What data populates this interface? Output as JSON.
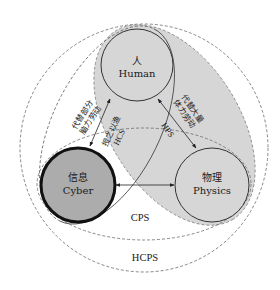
{
  "diagram": {
    "nodes": {
      "human": {
        "zh": "人",
        "en": "Human"
      },
      "cyber": {
        "zh": "信息",
        "en": "Cyber"
      },
      "physics": {
        "zh": "物理",
        "en": "Physics"
      }
    },
    "systems": {
      "cps": "CPS",
      "hcps": "HCPS",
      "hps": "HPS",
      "hcs": "HCS"
    },
    "edge_labels": {
      "human_cyber": {
        "line1": "代替部分",
        "line2": "脑力劳动"
      },
      "human_physics": {
        "line1": "代替大量",
        "line2": "体力劳动"
      },
      "hcs": {
        "line1": "授之以渔",
        "line2": "HCS"
      },
      "hps": "HPS"
    },
    "edges": [
      {
        "from": "human",
        "to": "cyber",
        "type": "bidirectional-arrow"
      },
      {
        "from": "human",
        "to": "physics",
        "type": "bidirectional-arrow"
      },
      {
        "from": "cyber",
        "to": "physics",
        "type": "bidirectional-arrow"
      }
    ],
    "colors": {
      "hps_region_fill": "#d6d6d6",
      "cyber_fill": "#acacac",
      "node_fill": "#d6d6d6",
      "stroke": "#333333",
      "dashed_stroke": "#6a6a6a"
    }
  }
}
